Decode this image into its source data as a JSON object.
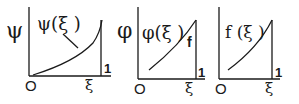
{
  "panels": [
    {
      "y_axis_label": "ψ",
      "curve_label": "ψ(ξ )",
      "origin_label": "O",
      "x_axis_label": "ξ",
      "end_label": "1"
    },
    {
      "y_axis_label": "φ",
      "curve_label": "φ(ξ )",
      "side_label": "f",
      "origin_label": "O",
      "x_axis_label": "ξ",
      "end_label": "1"
    },
    {
      "curve_label": "f (ξ )",
      "origin_label": "O",
      "x_axis_label": "ξ",
      "end_label": "1"
    }
  ],
  "colors": {
    "ink": "#1a1a1a",
    "background": "#ffffff"
  }
}
